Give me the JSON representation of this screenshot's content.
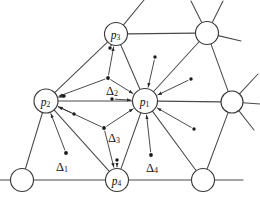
{
  "figure": {
    "background_color": "#ffffff",
    "line_color": "#4a4a4a",
    "arrow_color": "#2b2b2b",
    "label_color": "#111111",
    "width": 260,
    "height": 198
  },
  "chart_data": {
    "type": "diagram",
    "vertices": [
      {
        "id": "p1",
        "label": "p",
        "subscript": "1",
        "labeled": true,
        "x": 145,
        "y": 101,
        "r": 12.5
      },
      {
        "id": "p2",
        "label": "p",
        "subscript": "2",
        "labeled": true,
        "x": 46,
        "y": 101,
        "r": 12.0
      },
      {
        "id": "p3",
        "label": "p",
        "subscript": "3",
        "labeled": true,
        "x": 116,
        "y": 34,
        "r": 11.5
      },
      {
        "id": "p4",
        "label": "p",
        "subscript": "4",
        "labeled": true,
        "x": 117,
        "y": 180,
        "r": 11.5
      },
      {
        "id": "n1",
        "label": "",
        "subscript": "",
        "labeled": false,
        "x": 207,
        "y": 33,
        "r": 11.5
      },
      {
        "id": "n2",
        "label": "",
        "subscript": "",
        "labeled": false,
        "x": 232,
        "y": 102,
        "r": 11.0
      },
      {
        "id": "n3",
        "label": "",
        "subscript": "",
        "labeled": false,
        "x": 203,
        "y": 180,
        "r": 11.5
      },
      {
        "id": "n4",
        "label": "",
        "subscript": "",
        "labeled": false,
        "x": 22,
        "y": 180,
        "r": 11.5
      }
    ],
    "edges": [
      {
        "from": "p2",
        "to": "p3"
      },
      {
        "from": "p2",
        "to": "p1"
      },
      {
        "from": "p2",
        "to": "p4"
      },
      {
        "from": "p2",
        "to": "n4"
      },
      {
        "from": "p3",
        "to": "p1"
      },
      {
        "from": "p3",
        "to": "n1"
      },
      {
        "from": "p1",
        "to": "p4"
      },
      {
        "from": "p1",
        "to": "n1"
      },
      {
        "from": "p1",
        "to": "n2"
      },
      {
        "from": "p1",
        "to": "n3"
      },
      {
        "from": "n1",
        "to": "n2"
      },
      {
        "from": "n2",
        "to": "n3"
      },
      {
        "from": "p4",
        "to": "n4"
      },
      {
        "from": "p4",
        "to": "n3"
      }
    ],
    "boundary_stubs": [
      {
        "from": "p3",
        "dx": 28,
        "dy": -34
      },
      {
        "from": "n1",
        "dx": -16,
        "dy": -32
      },
      {
        "from": "n1",
        "dx": 16,
        "dy": -32
      },
      {
        "from": "n1",
        "dx": 34,
        "dy": 8
      },
      {
        "from": "n2",
        "dx": 26,
        "dy": -28
      },
      {
        "from": "n2",
        "dx": 28,
        "dy": 2
      },
      {
        "from": "n2",
        "dx": 22,
        "dy": 28
      },
      {
        "from": "n3",
        "dx": 40,
        "dy": 0
      },
      {
        "from": "n4",
        "dx": -30,
        "dy": 0
      }
    ],
    "triangle_markers": [
      {
        "id": "d1",
        "label": "Δ",
        "subscript": "1",
        "dot_x": 66,
        "dot_y": 153,
        "label_x": 62,
        "label_y": 167,
        "targets": [
          "p2"
        ]
      },
      {
        "id": "d2",
        "label": "Δ",
        "subscript": "2",
        "dot_x": 108,
        "dot_y": 78,
        "label_x": 112,
        "label_y": 91,
        "targets": [
          "p3",
          "p2",
          "p1"
        ]
      },
      {
        "id": "d3",
        "label": "Δ",
        "subscript": "3",
        "dot_x": 104,
        "dot_y": 128,
        "label_x": 114,
        "label_y": 138,
        "targets": [
          "p2",
          "p1",
          "p4"
        ]
      },
      {
        "id": "d4",
        "label": "Δ",
        "subscript": "4",
        "dot_x": 151,
        "dot_y": 155,
        "label_x": 152,
        "label_y": 168,
        "targets": [
          "p1"
        ]
      }
    ],
    "incidence_dots": [
      {
        "id": "a1",
        "x": 155,
        "y": 57,
        "target": "p1"
      },
      {
        "id": "a2",
        "x": 191,
        "y": 79,
        "target": "p1"
      },
      {
        "id": "a3",
        "x": 194,
        "y": 129,
        "target": "p1"
      },
      {
        "id": "a4",
        "x": 112,
        "y": 99,
        "target": "p1"
      },
      {
        "id": "a5",
        "x": 110,
        "y": 48,
        "target": "p3"
      },
      {
        "id": "a6",
        "x": 64,
        "y": 96,
        "target": "p2"
      },
      {
        "id": "a7",
        "x": 74,
        "y": 114,
        "target": "p2"
      },
      {
        "id": "a8",
        "x": 117,
        "y": 160,
        "target": "p4"
      }
    ],
    "legend": [],
    "grid": false
  },
  "labels": {
    "p1": {
      "base": "p",
      "sub": "1"
    },
    "p2": {
      "base": "p",
      "sub": "2"
    },
    "p3": {
      "base": "p",
      "sub": "3"
    },
    "p4": {
      "base": "p",
      "sub": "4"
    },
    "d1": {
      "base": "Δ",
      "sub": "1"
    },
    "d2": {
      "base": "Δ",
      "sub": "2"
    },
    "d3": {
      "base": "Δ",
      "sub": "3"
    },
    "d4": {
      "base": "Δ",
      "sub": "4"
    }
  }
}
